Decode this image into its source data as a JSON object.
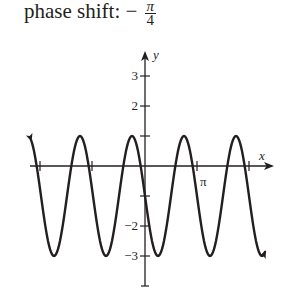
{
  "header": {
    "label": "phase shift:",
    "sign": "−",
    "frac_num": "π",
    "frac_den": "4"
  },
  "axes": {
    "x_label": "x",
    "y_label": "y",
    "x_tick_label": "π",
    "y_tick_labels": [
      "3",
      "2",
      "−2",
      "−3"
    ]
  },
  "chart_data": {
    "type": "line",
    "function": "y = 2cos(2(x + π/4)) − 1",
    "xlabel": "x",
    "ylabel": "y",
    "xlim": [
      -2.25,
      2.35
    ],
    "xlim_units": "multiples of π",
    "ylim": [
      -4,
      4
    ],
    "x_ticks": [
      "-2π",
      "-π",
      "π",
      "2π"
    ],
    "x_tick_labels_shown": [
      "π"
    ],
    "y_ticks": [
      3,
      2,
      1,
      -1,
      -2,
      -3
    ],
    "y_tick_labels_shown": [
      "3",
      "2",
      "-2",
      "-3"
    ],
    "amplitude": 2,
    "period": "π",
    "midline": -1,
    "max": 1,
    "min": -3,
    "maxima_x": [
      "-9π/4",
      "-5π/4",
      "-π/4",
      "3π/4",
      "7π/4"
    ],
    "minima_x": [
      "-7π/4",
      "-3π/4",
      "π/4",
      "5π/4"
    ],
    "y_intercept": -1,
    "grid": false,
    "color": "#231f20"
  }
}
